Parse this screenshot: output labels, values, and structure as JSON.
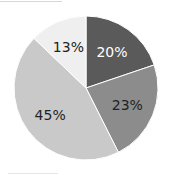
{
  "chart_data": {
    "type": "pie",
    "title": "",
    "categories": [
      "A",
      "B",
      "C",
      "D"
    ],
    "values": [
      20,
      23,
      45,
      13
    ],
    "labels": [
      "20%",
      "23%",
      "45%",
      "13%"
    ],
    "colors": [
      "#5a5a5a",
      "#8c8c8c",
      "#c9c9c9",
      "#efefef"
    ],
    "label_colors": [
      "#ffffff",
      "#222222",
      "#222222",
      "#222222"
    ],
    "start_angle_deg": 0,
    "direction": "clockwise",
    "legend": "none"
  }
}
